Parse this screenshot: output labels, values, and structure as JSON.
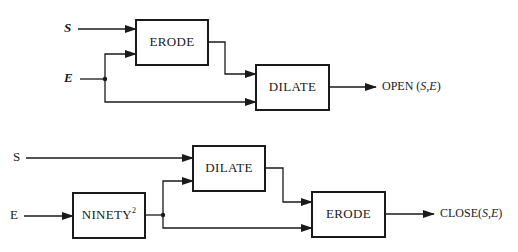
{
  "opening": {
    "inputs": {
      "s_label": "S",
      "e_label": "E"
    },
    "blocks": {
      "erode": "ERODE",
      "dilate": "DILATE"
    },
    "output": {
      "name": "OPEN ",
      "open_paren": "(",
      "arg1": "S",
      "comma": ",",
      "arg2": "E",
      "close_paren": ")"
    }
  },
  "closing": {
    "inputs": {
      "s_label": "S",
      "e_label": "E"
    },
    "blocks": {
      "ninety": "NINETY",
      "ninety_sup": "2",
      "dilate": "DILATE",
      "erode": "ERODE"
    },
    "output": {
      "name": "CLOSE",
      "open_paren": "(",
      "arg1": "S",
      "comma": ",",
      "arg2": "E",
      "close_paren": ")"
    }
  },
  "colors": {
    "ink": "#1a1a1a",
    "background": "#ffffff"
  }
}
